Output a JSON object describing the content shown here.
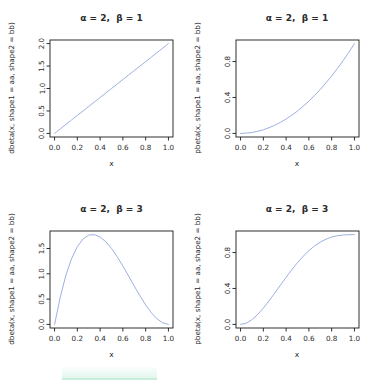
{
  "page": {
    "background_color": "#ffffff",
    "layout": "2x2 R base-graphics beta distribution plots"
  },
  "style": {
    "axis_color": "#1a1a1a",
    "text_color": "#2b2b2b",
    "curve_color": "#9db0e0"
  },
  "artifact": {
    "description": "faint mint highlight smudge at bottom of page",
    "band_color": "#e4f6ee",
    "edge_color": "#c7eedd"
  },
  "chart_data": [
    {
      "type": "line",
      "title": "α = 2,  β = 1",
      "xlabel": "x",
      "ylabel": "dbeta(x, shape1 = aa, shape2 = bb)",
      "xlim": [
        0,
        1
      ],
      "ylim": [
        0,
        2
      ],
      "xticks": [
        "0.0",
        "0.2",
        "0.4",
        "0.6",
        "0.8",
        "1.0"
      ],
      "xtick_values": [
        0,
        0.2,
        0.4,
        0.6,
        0.8,
        1
      ],
      "yticks": [
        "0.0",
        "0.5",
        "1.0",
        "1.5",
        "2.0"
      ],
      "ytick_values": [
        0,
        0.5,
        1,
        1.5,
        2
      ],
      "grid": false,
      "legend": null,
      "line_color": "#9db0e0",
      "series": [
        {
          "name": "dbeta(x, 2, 1)",
          "x": [
            0,
            0.05,
            0.1,
            0.15,
            0.2,
            0.25,
            0.3,
            0.35,
            0.4,
            0.45,
            0.5,
            0.55,
            0.6,
            0.65,
            0.7,
            0.75,
            0.8,
            0.85,
            0.9,
            0.95,
            1
          ],
          "y": [
            0,
            0.1,
            0.2,
            0.3,
            0.4,
            0.5,
            0.6,
            0.7,
            0.8,
            0.9,
            1,
            1.1,
            1.2,
            1.3,
            1.4,
            1.5,
            1.6,
            1.7,
            1.8,
            1.9,
            2
          ]
        }
      ]
    },
    {
      "type": "line",
      "title": "α = 2,  β = 1",
      "xlabel": "x",
      "ylabel": "pbeta(x, shape1 = aa, shape2 = bb)",
      "xlim": [
        0,
        1
      ],
      "ylim": [
        0,
        1
      ],
      "xticks": [
        "0.0",
        "0.2",
        "0.4",
        "0.6",
        "0.8",
        "1.0"
      ],
      "xtick_values": [
        0,
        0.2,
        0.4,
        0.6,
        0.8,
        1
      ],
      "yticks": [
        "0.0",
        "0.4",
        "0.8"
      ],
      "ytick_values": [
        0,
        0.4,
        0.8
      ],
      "grid": false,
      "legend": null,
      "line_color": "#9db0e0",
      "series": [
        {
          "name": "pbeta(x, 2, 1)",
          "x": [
            0,
            0.05,
            0.1,
            0.15,
            0.2,
            0.25,
            0.3,
            0.35,
            0.4,
            0.45,
            0.5,
            0.55,
            0.6,
            0.65,
            0.7,
            0.75,
            0.8,
            0.85,
            0.9,
            0.95,
            1
          ],
          "y": [
            0,
            0.003,
            0.01,
            0.023,
            0.04,
            0.063,
            0.09,
            0.123,
            0.16,
            0.203,
            0.25,
            0.303,
            0.36,
            0.423,
            0.49,
            0.563,
            0.64,
            0.723,
            0.81,
            0.903,
            1
          ]
        }
      ]
    },
    {
      "type": "line",
      "title": "α = 2,  β = 3",
      "xlabel": "x",
      "ylabel": "dbeta(x, shape1 = aa, shape2 = bb)",
      "xlim": [
        0,
        1
      ],
      "ylim": [
        0,
        1.775
      ],
      "xticks": [
        "0.0",
        "0.2",
        "0.4",
        "0.6",
        "0.8",
        "1.0"
      ],
      "xtick_values": [
        0,
        0.2,
        0.4,
        0.6,
        0.8,
        1
      ],
      "yticks": [
        "0.0",
        "0.5",
        "1.0",
        "1.5"
      ],
      "ytick_values": [
        0,
        0.5,
        1,
        1.5
      ],
      "grid": false,
      "legend": null,
      "line_color": "#9db0e0",
      "series": [
        {
          "name": "dbeta(x, 2, 3)",
          "x": [
            0,
            0.05,
            0.1,
            0.15,
            0.2,
            0.25,
            0.3,
            0.35,
            0.4,
            0.45,
            0.5,
            0.55,
            0.6,
            0.65,
            0.7,
            0.75,
            0.8,
            0.85,
            0.9,
            0.95,
            1
          ],
          "y": [
            0,
            0.542,
            0.972,
            1.301,
            1.536,
            1.688,
            1.764,
            1.775,
            1.728,
            1.634,
            1.5,
            1.337,
            1.152,
            0.956,
            0.756,
            0.563,
            0.384,
            0.23,
            0.108,
            0.029,
            0
          ]
        }
      ]
    },
    {
      "type": "line",
      "title": "α = 2,  β = 3",
      "xlabel": "x",
      "ylabel": "pbeta(x, shape1 = aa, shape2 = bb)",
      "xlim": [
        0,
        1
      ],
      "ylim": [
        0,
        1
      ],
      "xticks": [
        "0.0",
        "0.2",
        "0.4",
        "0.6",
        "0.8",
        "1.0"
      ],
      "xtick_values": [
        0,
        0.2,
        0.4,
        0.6,
        0.8,
        1
      ],
      "yticks": [
        "0.0",
        "0.4",
        "0.8"
      ],
      "ytick_values": [
        0,
        0.4,
        0.8
      ],
      "grid": false,
      "legend": null,
      "line_color": "#9db0e0",
      "series": [
        {
          "name": "pbeta(x, 2, 3)",
          "x": [
            0,
            0.05,
            0.1,
            0.15,
            0.2,
            0.25,
            0.3,
            0.35,
            0.4,
            0.45,
            0.5,
            0.55,
            0.6,
            0.65,
            0.7,
            0.75,
            0.8,
            0.85,
            0.9,
            0.95,
            1
          ],
          "y": [
            0,
            0.014,
            0.052,
            0.11,
            0.181,
            0.262,
            0.348,
            0.437,
            0.525,
            0.609,
            0.688,
            0.759,
            0.821,
            0.874,
            0.916,
            0.949,
            0.973,
            0.988,
            0.996,
            0.999,
            1
          ]
        }
      ]
    }
  ]
}
